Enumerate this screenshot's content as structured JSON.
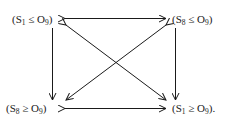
{
  "diagram": {
    "type": "commutative-square",
    "nodes": {
      "top_left": {
        "lhs": "S",
        "lhs_sub": "1",
        "rel": "≤",
        "rhs": "O",
        "rhs_sub": "9",
        "suffix": ""
      },
      "top_right": {
        "lhs": "S",
        "lhs_sub": "8",
        "rel": "≤",
        "rhs": "O",
        "rhs_sub": "9",
        "suffix": ""
      },
      "bottom_left": {
        "lhs": "S",
        "lhs_sub": "8",
        "rel": "≥",
        "rhs": "O",
        "rhs_sub": "9",
        "suffix": ""
      },
      "bottom_right": {
        "lhs": "S",
        "lhs_sub": "1",
        "rel": "≥",
        "rhs": "O",
        "rhs_sub": "9",
        "suffix": "."
      }
    },
    "edges": [
      {
        "from": "top_left",
        "to": "top_right",
        "style": "bidirectional"
      },
      {
        "from": "bottom_left",
        "to": "bottom_right",
        "style": "bidirectional"
      },
      {
        "from": "top_left",
        "to": "bottom_left",
        "style": "directed"
      },
      {
        "from": "top_right",
        "to": "bottom_right",
        "style": "directed"
      },
      {
        "from": "top_left",
        "to": "bottom_right",
        "style": "bidirectional"
      },
      {
        "from": "top_right",
        "to": "bottom_left",
        "style": "bidirectional"
      }
    ],
    "colors": {
      "ink": "#1a1a1a",
      "background": "#ffffff"
    }
  }
}
